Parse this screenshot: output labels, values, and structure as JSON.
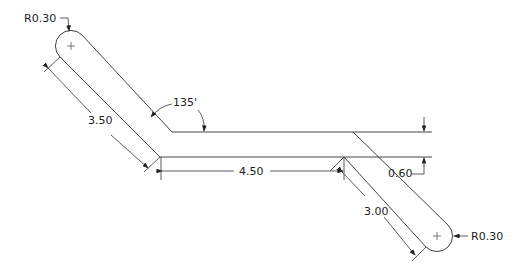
{
  "drawing": {
    "type": "technical-drawing",
    "subject": "slot bracket with two radiused ends",
    "line_color": "#333333",
    "background": "#ffffff"
  },
  "dimensions": {
    "radius_top_left": "R0.30",
    "radius_bottom_right": "R0.30",
    "length_left_arm": "3.50",
    "length_middle": "4.50",
    "length_right_arm": "3.00",
    "width": "0.60",
    "angle": "135'"
  }
}
